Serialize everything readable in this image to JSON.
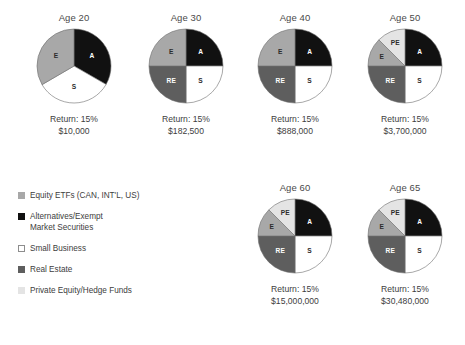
{
  "colors": {
    "alternatives": "#111111",
    "equity": "#a8a8a8",
    "small_business": "#ffffff",
    "real_estate": "#5e5e5e",
    "private_equity": "#e4e4e4",
    "outline": "#6d6d6d",
    "text": "#3d3d3d"
  },
  "legend": {
    "items": [
      {
        "label": "Equity ETFs (CAN, INT'L, US)",
        "label2": "",
        "swatch": "equity",
        "code": "E"
      },
      {
        "label": "Alternatives/Exempt",
        "label2": "Market Securities",
        "swatch": "alternatives",
        "code": "A"
      },
      {
        "label": "Small Business",
        "label2": "",
        "swatch": "small_business",
        "code": "S"
      },
      {
        "label": "Real Estate",
        "label2": "",
        "swatch": "real_estate",
        "code": "RE"
      },
      {
        "label": "Private Equity/Hedge Funds",
        "label2": "",
        "swatch": "private_equity",
        "code": "PE"
      }
    ]
  },
  "chart_data": {
    "type": "pie",
    "title": "",
    "legend_position": "left-bottom",
    "return_label": "Return: 15%",
    "series_note": "Each pie shows portfolio allocation at a given age; all returns 15%.",
    "charts": [
      {
        "title": "Age 20",
        "return": "Return: 15%",
        "amount": "$10,000",
        "slices": [
          {
            "code": "A",
            "label": "A",
            "value": 33.3,
            "color": "alternatives"
          },
          {
            "code": "S",
            "label": "S",
            "value": 33.3,
            "color": "small_business"
          },
          {
            "code": "E",
            "label": "E",
            "value": 33.4,
            "color": "equity"
          }
        ]
      },
      {
        "title": "Age 30",
        "return": "Return: 15%",
        "amount": "$182,500",
        "slices": [
          {
            "code": "A",
            "label": "A",
            "value": 25,
            "color": "alternatives"
          },
          {
            "code": "S",
            "label": "S",
            "value": 25,
            "color": "small_business"
          },
          {
            "code": "RE",
            "label": "RE",
            "value": 25,
            "color": "real_estate"
          },
          {
            "code": "E",
            "label": "E",
            "value": 25,
            "color": "equity"
          }
        ]
      },
      {
        "title": "Age 40",
        "return": "Return: 15%",
        "amount": "$888,000",
        "slices": [
          {
            "code": "A",
            "label": "A",
            "value": 25,
            "color": "alternatives"
          },
          {
            "code": "S",
            "label": "S",
            "value": 25,
            "color": "small_business"
          },
          {
            "code": "RE",
            "label": "RE",
            "value": 25,
            "color": "real_estate"
          },
          {
            "code": "E",
            "label": "E",
            "value": 25,
            "color": "equity"
          }
        ]
      },
      {
        "title": "Age 50",
        "return": "Return: 15%",
        "amount": "$3,700,000",
        "slices": [
          {
            "code": "A",
            "label": "A",
            "value": 25,
            "color": "alternatives"
          },
          {
            "code": "S",
            "label": "S",
            "value": 25,
            "color": "small_business"
          },
          {
            "code": "RE",
            "label": "RE",
            "value": 25,
            "color": "real_estate"
          },
          {
            "code": "E",
            "label": "E",
            "value": 12.5,
            "color": "equity"
          },
          {
            "code": "PE",
            "label": "PE",
            "value": 12.5,
            "color": "private_equity"
          }
        ]
      },
      {
        "title": "Age 60",
        "return": "Return: 15%",
        "amount": "$15,000,000",
        "slices": [
          {
            "code": "A",
            "label": "A",
            "value": 25,
            "color": "alternatives"
          },
          {
            "code": "S",
            "label": "S",
            "value": 25,
            "color": "small_business"
          },
          {
            "code": "RE",
            "label": "RE",
            "value": 25,
            "color": "real_estate"
          },
          {
            "code": "E",
            "label": "E",
            "value": 12.5,
            "color": "equity"
          },
          {
            "code": "PE",
            "label": "PE",
            "value": 12.5,
            "color": "private_equity"
          }
        ]
      },
      {
        "title": "Age 65",
        "return": "Return: 15%",
        "amount": "$30,480,000",
        "slices": [
          {
            "code": "A",
            "label": "A",
            "value": 25,
            "color": "alternatives"
          },
          {
            "code": "S",
            "label": "S",
            "value": 25,
            "color": "small_business"
          },
          {
            "code": "RE",
            "label": "RE",
            "value": 25,
            "color": "real_estate"
          },
          {
            "code": "E",
            "label": "E",
            "value": 12.5,
            "color": "equity"
          },
          {
            "code": "PE",
            "label": "PE",
            "value": 12.5,
            "color": "private_equity"
          }
        ]
      }
    ]
  },
  "layout": {
    "positions": [
      {
        "left": 19,
        "top": 12
      },
      {
        "left": 131,
        "top": 12
      },
      {
        "left": 240,
        "top": 12
      },
      {
        "left": 350,
        "top": 12
      },
      {
        "left": 240,
        "top": 182
      },
      {
        "left": 350,
        "top": 182
      }
    ]
  }
}
